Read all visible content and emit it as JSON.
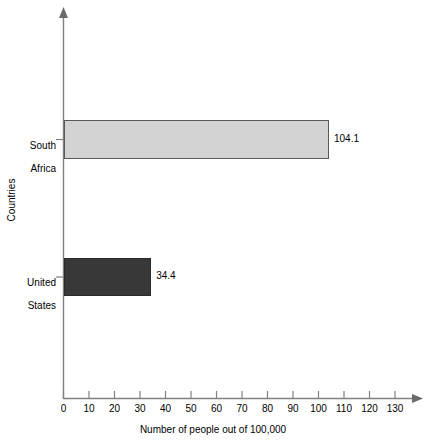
{
  "chart_data": {
    "type": "bar",
    "orientation": "horizontal",
    "title": "",
    "xlabel": "Number of people out of 100,000",
    "ylabel": "Countries",
    "categories": [
      "South Africa",
      "United States"
    ],
    "category_lines": [
      [
        "South",
        "Africa"
      ],
      [
        "United",
        "States"
      ]
    ],
    "values": [
      104.1,
      34.4
    ],
    "value_labels": [
      "104.1",
      "34.4"
    ],
    "bar_colors": [
      "#d2d2d2",
      "#383838"
    ],
    "bar_edge_color": "#595959",
    "xlim": [
      0,
      130
    ],
    "ylim": [
      0,
      2
    ],
    "xticks": [
      0,
      10,
      20,
      30,
      40,
      50,
      60,
      70,
      80,
      90,
      100,
      110,
      120,
      130
    ],
    "xtick_labels": [
      "0",
      "10",
      "20",
      "30",
      "40",
      "50",
      "60",
      "70",
      "80",
      "90",
      "100",
      "110",
      "120",
      "130"
    ],
    "grid": false,
    "legend": false,
    "axis_arrows": true,
    "axis_color": "#808080"
  },
  "axes": {
    "x_title": "Number of people out of 100,000",
    "y_title": "Countries"
  }
}
